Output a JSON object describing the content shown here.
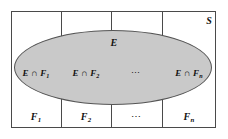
{
  "diagram": {
    "type": "venn-partition-diagram",
    "universe_label": "S",
    "event_label": "E",
    "colors": {
      "event_fill": "#c9c9c9",
      "event_stroke": "#555555",
      "universe_fill": "#ffffff",
      "universe_stroke": "#4a4a4a",
      "text": "#111111"
    },
    "intersections": [
      {
        "label": "E ∩ F",
        "subscript": "1"
      },
      {
        "label": "E ∩ F",
        "subscript": "2"
      },
      {
        "label": "⋯",
        "subscript": ""
      },
      {
        "label": "E ∩ F",
        "subscript": "n"
      }
    ],
    "partition_blocks": [
      {
        "label": "F",
        "subscript": "1"
      },
      {
        "label": "F",
        "subscript": "2"
      },
      {
        "label": "⋯",
        "subscript": ""
      },
      {
        "label": "F",
        "subscript": "n"
      }
    ]
  }
}
